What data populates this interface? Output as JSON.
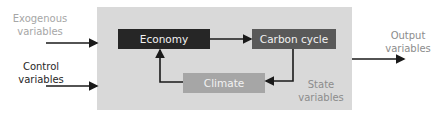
{
  "diagram": {
    "inputs": {
      "exogenous": "Exogenous variables",
      "control": "Control variables"
    },
    "nodes": {
      "economy": "Economy",
      "carbon_cycle": "Carbon cycle",
      "climate": "Climate"
    },
    "state_label": "State variables",
    "output_label": "Output variables",
    "colors": {
      "panel": "#d9d9d9",
      "economy": "#262626",
      "carbon_cycle": "#595959",
      "climate": "#a6a6a6",
      "arrows": "#1a1a1a"
    },
    "edges": [
      {
        "from": "exogenous",
        "to": "system"
      },
      {
        "from": "control",
        "to": "system"
      },
      {
        "from": "economy",
        "to": "carbon_cycle"
      },
      {
        "from": "carbon_cycle",
        "to": "climate"
      },
      {
        "from": "climate",
        "to": "economy"
      },
      {
        "from": "system",
        "to": "output"
      }
    ]
  }
}
